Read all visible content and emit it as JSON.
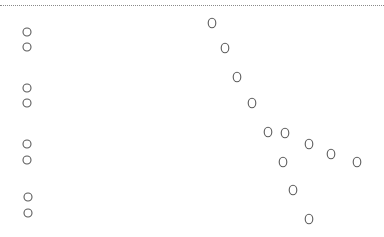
{
  "page": {
    "background": "#ffffff",
    "rule_color": "#8a8a8a",
    "circle_stroke": "#5a5a5a",
    "circle_fill": "#ffffff"
  },
  "radio_column": {
    "count": 8,
    "groups": [
      {
        "items": [
          "",
          ""
        ]
      },
      {
        "items": [
          "",
          ""
        ]
      },
      {
        "items": [
          "",
          ""
        ]
      },
      {
        "items": [
          "",
          ""
        ]
      }
    ]
  },
  "scatter": {
    "description": "unlabeled open-circle markers",
    "points": [
      {
        "id": 1
      },
      {
        "id": 2
      },
      {
        "id": 3
      },
      {
        "id": 4
      },
      {
        "id": 5
      },
      {
        "id": 6
      },
      {
        "id": 7
      },
      {
        "id": 8
      },
      {
        "id": 9
      },
      {
        "id": 10
      },
      {
        "id": 11
      },
      {
        "id": 12
      }
    ]
  }
}
